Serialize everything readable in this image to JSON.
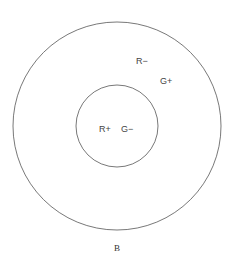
{
  "diagram": {
    "type": "concentric-circles",
    "stroke_color": "#555555",
    "outer_circle": {
      "cx": 117,
      "cy": 126,
      "r": 104
    },
    "inner_circle": {
      "cx": 117,
      "cy": 126,
      "r": 41
    },
    "labels": {
      "outer_r": "R−",
      "outer_g": "G+",
      "inner_r": "R+",
      "inner_g": "G−",
      "bottom": "B"
    }
  }
}
